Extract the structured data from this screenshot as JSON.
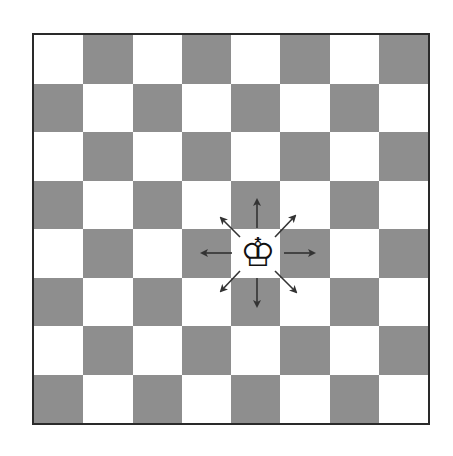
{
  "board": {
    "rows": 8,
    "cols": 8,
    "top_left_color": "light",
    "colors": {
      "light": "#ffffff",
      "dark": "#8e8e8e",
      "border": "#2a2a2a"
    }
  },
  "pieces": [
    {
      "type": "king",
      "color": "white",
      "glyph": "♔",
      "row": 4,
      "col": 4
    }
  ],
  "move_arrows": {
    "piece": "king",
    "directions": [
      "up",
      "up-right",
      "right",
      "down-right",
      "down",
      "down-left",
      "left",
      "up-left"
    ],
    "color": "#333333"
  }
}
